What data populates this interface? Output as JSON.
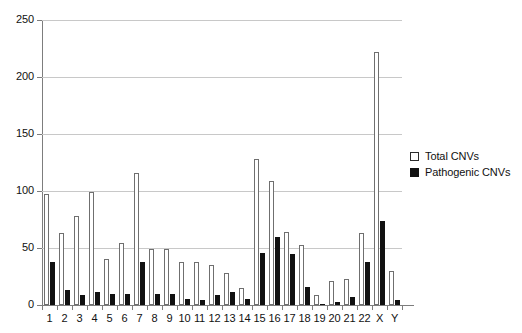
{
  "chart_data": {
    "type": "bar",
    "title": "",
    "subtitle": "",
    "xlabel": "",
    "ylabel": "",
    "ylim": [
      0,
      250
    ],
    "yticks": [
      0,
      50,
      100,
      150,
      200,
      250
    ],
    "grid": true,
    "legend_position": "right",
    "categories": [
      "1",
      "2",
      "3",
      "4",
      "5",
      "6",
      "7",
      "8",
      "9",
      "10",
      "11",
      "12",
      "13",
      "14",
      "15",
      "16",
      "17",
      "18",
      "19",
      "20",
      "21",
      "22",
      "X",
      "Y"
    ],
    "series": [
      {
        "name": "Total CNVs",
        "color": "#ffffff",
        "edge_color": "#6f6f6f",
        "values": [
          97,
          63,
          78,
          99,
          40,
          54,
          116,
          49,
          49,
          38,
          38,
          35,
          28,
          15,
          128,
          109,
          64,
          53,
          9,
          21,
          23,
          63,
          222,
          30
        ]
      },
      {
        "name": "Pathogenic CNVs",
        "color": "#111111",
        "edge_color": "#111111",
        "values": [
          38,
          13,
          9,
          11,
          10,
          10,
          38,
          10,
          10,
          5,
          4,
          9,
          11,
          5,
          46,
          60,
          45,
          16,
          1,
          3,
          7,
          38,
          74,
          4
        ]
      }
    ]
  },
  "legend": {
    "items": [
      {
        "label": "Total CNVs",
        "swatch": "open-square"
      },
      {
        "label": "Pathogenic CNVs",
        "swatch": "filled-square"
      }
    ]
  },
  "axes": {
    "y_tick_labels": [
      "0",
      "50",
      "100",
      "150",
      "200",
      "250"
    ],
    "x_tick_labels": [
      "1",
      "2",
      "3",
      "4",
      "5",
      "6",
      "7",
      "8",
      "9",
      "10",
      "11",
      "12",
      "13",
      "14",
      "15",
      "16",
      "17",
      "18",
      "19",
      "20",
      "21",
      "22",
      "X",
      "Y"
    ]
  }
}
